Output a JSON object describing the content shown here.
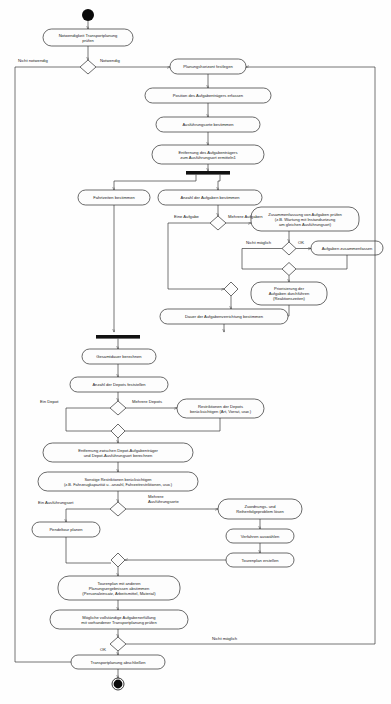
{
  "diagram": {
    "type": "uml-activity-diagram",
    "nodes": {
      "start": {
        "kind": "initial-node"
      },
      "a1": {
        "label": "Notwendigkeit Transportplanung\nprüfen"
      },
      "a2": {
        "label": "Planungshorizont festlegen"
      },
      "a3": {
        "label": "Position des Aufgabenträgers erfassen"
      },
      "a4": {
        "label": "Ausführungsorte bestimmen"
      },
      "a5": {
        "label": "Entfernung des Aufgabenträgers\nzum Ausführungsort ermitteln1"
      },
      "a6": {
        "label": "Fahrtzeiten bestimmen"
      },
      "a7": {
        "label": "Anzahl der Aufgaben bestimmen"
      },
      "a8": {
        "label": "Zusammenfassung von Aufgaben prüfen\n(z.B. Wartung mit Instandsetzung\nam gleichen Ausführungsort)"
      },
      "a9": {
        "label": "Aufgaben zusammenfassen"
      },
      "a10": {
        "label": "Priorisierung der\nAufgaben durchführen\n(Reaktionszeiten)"
      },
      "a11": {
        "label": "Dauer der Aufgabenverrichtung bestimmen"
      },
      "a12": {
        "label": "Gesamtdauer berechnen"
      },
      "a13": {
        "label": "Anzahl der Depots feststellen"
      },
      "a14": {
        "label": "Restriktionen der Depots\nberücksichtigen (Art, Vorrat,  usw.)"
      },
      "a15": {
        "label": "Entfernung  zwischen Depot-Aufgabenträger\nund Depot-Ausführungsort berechnen"
      },
      "a16": {
        "label": "Sonstige Restriktionen berücksichtigen\n(z.B. Fahrzeugkapazität u. -anzahl, Fahrzeitrestriktionen, usw.)"
      },
      "a17": {
        "label": "Pendeltour planen"
      },
      "a18": {
        "label": "Zuordnungs- und\nReihenfolgeproblem lösen"
      },
      "a19": {
        "label": "Verfahren auswählen"
      },
      "a20": {
        "label": "Tourenplan erstellen"
      },
      "a21": {
        "label": "Tourenplan mit anderen\nPlanungsergebnissen abstimmen\n(Personaleinsatz, Arbeitsmittel, Material)"
      },
      "a22": {
        "label": "Mögliche vollständige Aufgabenerfüllung\nmit vorhandener Transportplanung prüfen"
      },
      "a23": {
        "label": "Transportplanung abschließen"
      },
      "end": {
        "kind": "final-node"
      }
    },
    "guards": {
      "g_nicht_notwendig": "Nicht notwendig",
      "g_notwendig": "Notwendig",
      "g_eine_aufgabe": "Eine Aufgabe",
      "g_mehrere_aufgaben": "Mehrere Aufgaben",
      "g_nicht_moeglich_1": "Nicht möglich",
      "g_ok_1": "OK",
      "g_ein_depot": "Ein Depot",
      "g_mehrere_depots": "Mehrere Depots",
      "g_ein_ausfuehrungsort": "Ein Ausführungsort",
      "g_mehrere_ausfuehrungsorte": "Mehrere\nAusführungsorte",
      "g_nicht_moeglich_2": "Nicht möglich",
      "g_ok_2": "OK"
    },
    "colors": {
      "stroke": "#2b2b2b",
      "fill": "#fdfdfd",
      "bar": "#111111",
      "text": "#1a1a1a",
      "background": "#fefefe"
    }
  }
}
